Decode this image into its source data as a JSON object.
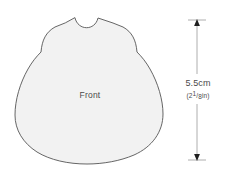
{
  "figure": {
    "type": "sewing-pattern-diagram",
    "background_color": "#ffffff",
    "piece": {
      "label": "Front",
      "fill_color": "#f2f2f2",
      "outline_color": "#555555",
      "description": "sleeveless A-line garment front pattern piece with scoop neckline and flared curved hem"
    },
    "dimension": {
      "measurement_metric": "5.5cm",
      "measurement_imperial_open": "(2",
      "measurement_imperial_numerator": "1",
      "measurement_imperial_slash": "/",
      "measurement_imperial_denominator": "8",
      "measurement_imperial_close": "in)",
      "orientation": "vertical",
      "arrow_style": "double-headed-with-tick-caps",
      "line_color": "#808080",
      "text_color": "#4a4a4a"
    }
  }
}
